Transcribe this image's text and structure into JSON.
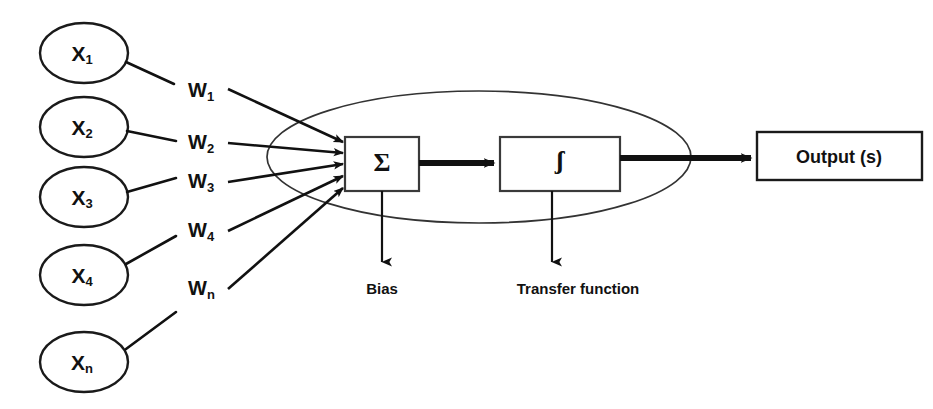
{
  "diagram": {
    "type": "block-diagram",
    "background_color": "#ffffff",
    "stroke_color": "#111111"
  },
  "inputs": {
    "group_label": "input-nodes",
    "nodes": [
      {
        "id": "x1",
        "base": "X",
        "sub": "1",
        "cx": 84,
        "cy": 53
      },
      {
        "id": "x2",
        "base": "X",
        "sub": "2",
        "cx": 84,
        "cy": 127
      },
      {
        "id": "x3",
        "base": "X",
        "sub": "3",
        "cx": 84,
        "cy": 197
      },
      {
        "id": "x4",
        "base": "X",
        "sub": "4",
        "cx": 84,
        "cy": 275
      },
      {
        "id": "xn",
        "base": "X",
        "sub": "n",
        "cx": 84,
        "cy": 362
      }
    ],
    "node_rx": 44,
    "node_ry": 30
  },
  "weights": {
    "group_label": "weight-labels",
    "items": [
      {
        "id": "w1",
        "base": "W",
        "sub": "1",
        "x": 188,
        "y": 92
      },
      {
        "id": "w2",
        "base": "W",
        "sub": "2",
        "x": 188,
        "y": 144
      },
      {
        "id": "w3",
        "base": "W",
        "sub": "3",
        "x": 188,
        "y": 183
      },
      {
        "id": "w4",
        "base": "W",
        "sub": "4",
        "x": 188,
        "y": 232
      },
      {
        "id": "wn",
        "base": "W",
        "sub": "n",
        "x": 188,
        "y": 290
      }
    ]
  },
  "soma": {
    "label": "neuron-body-ellipse",
    "cx": 479,
    "cy": 157,
    "rx": 212,
    "ry": 66
  },
  "summation": {
    "label": "summation-block",
    "symbol": "Σ",
    "symbol_name": "sigma-summation-symbol",
    "x": 345,
    "y": 137,
    "width": 74,
    "height": 54
  },
  "transfer": {
    "label": "transfer-function-block",
    "symbol": "ʃ",
    "symbol_name": "integral-transfer-symbol",
    "x": 500,
    "y": 137,
    "width": 120,
    "height": 54
  },
  "captions": [
    {
      "id": "bias",
      "text": "Bias",
      "x": 382,
      "y": 290
    },
    {
      "id": "transfer-function",
      "text": "Transfer function",
      "x": 578,
      "y": 290
    }
  ],
  "output": {
    "label": "output-block",
    "text": "Output (s)",
    "x": 757,
    "y": 132,
    "width": 165,
    "height": 48
  }
}
